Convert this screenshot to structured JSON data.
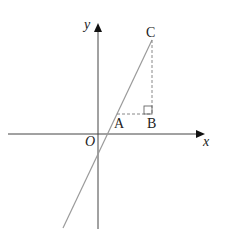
{
  "diagram": {
    "type": "coordinate-geometry",
    "axes": {
      "x_label": "x",
      "y_label": "y",
      "origin_label": "O"
    },
    "points": {
      "A": "A",
      "B": "B",
      "C": "C"
    },
    "elements": [
      "line through C and A crossing both axes",
      "dashed segment A to B (horizontal)",
      "dashed segment B to C (vertical)",
      "right-angle marker at B"
    ],
    "colors": {
      "axes": "#333333",
      "line": "#999999",
      "dashed": "#999999",
      "text": "#222222"
    }
  }
}
